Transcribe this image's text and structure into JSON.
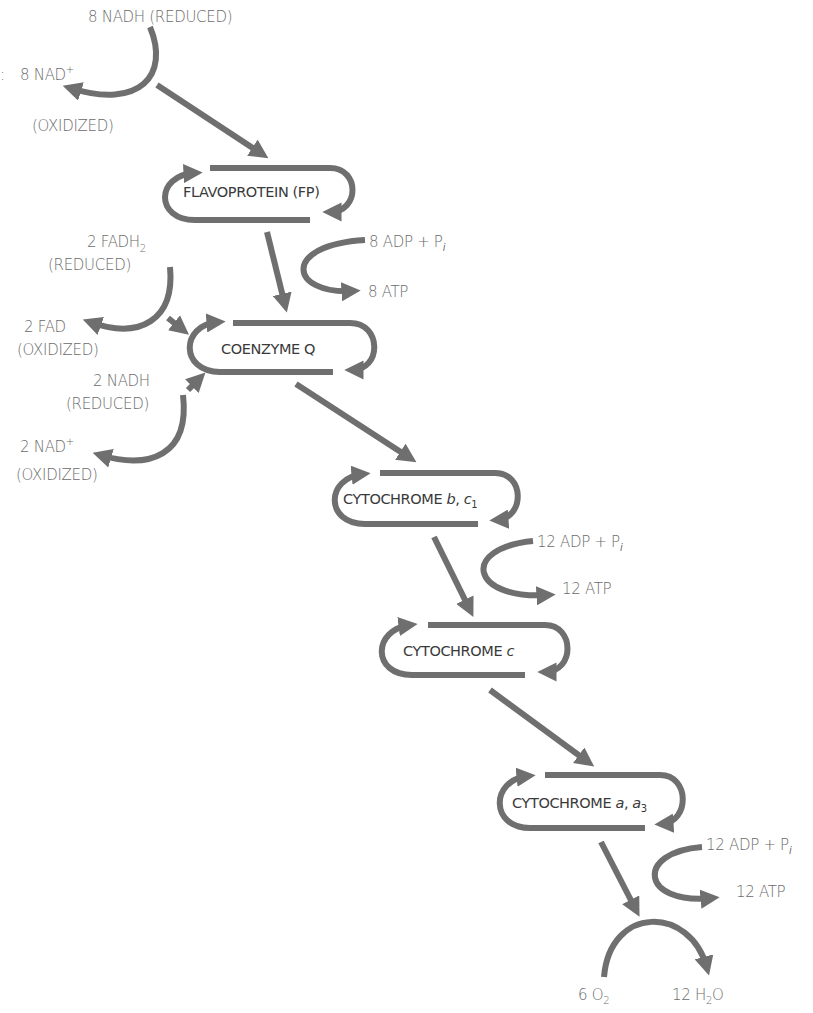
{
  "diagram": {
    "colors": {
      "arrow": "#6f6f6f",
      "text": "#6b6b6b",
      "box_text": "#3a3a3a",
      "background": "#ffffff"
    },
    "top_input": {
      "reduced": "8 NADH (REDUCED)",
      "oxidized_prefix": "8 NAD",
      "oxidized_sup": "+",
      "oxidized_state": "(OXIDIZED)"
    },
    "carriers": [
      {
        "name": "FLAVOPROTEIN (FP)"
      },
      {
        "name": "COENZYME Q"
      },
      {
        "name": "CYTOCHROME ",
        "italic": "b",
        "sep": ", ",
        "italic2": "c",
        "sub": "1"
      },
      {
        "name": "CYTOCHROME ",
        "italic": "c"
      },
      {
        "name": "CYTOCHROME ",
        "italic": "a",
        "sep": ", ",
        "italic2": "a",
        "sub": "3"
      }
    ],
    "side_inputs": {
      "fadh2": {
        "reduced_prefix": "2 FADH",
        "reduced_sub": "2",
        "reduced_state": "(REDUCED)",
        "oxidized": "2 FAD",
        "oxidized_state": "(OXIDIZED)"
      },
      "nadh2": {
        "reduced": "2 NADH",
        "reduced_state": "(REDUCED)",
        "oxidized_prefix": "2 NAD",
        "oxidized_sup": "+",
        "oxidized_state": "(OXIDIZED)"
      }
    },
    "phosphorylation": [
      {
        "input_prefix": "8 ADP + P",
        "input_sub": "i",
        "output": "8 ATP"
      },
      {
        "input_prefix": "12 ADP + P",
        "input_sub": "i",
        "output": "12 ATP"
      },
      {
        "input_prefix": "12 ADP + P",
        "input_sub": "i",
        "output": "12 ATP"
      }
    ],
    "final": {
      "o2_prefix": "6 O",
      "o2_sub": "2",
      "h2o_prefix": "12 H",
      "h2o_sub": "2",
      "h2o_suffix": "O"
    },
    "edge_mark": ":"
  }
}
